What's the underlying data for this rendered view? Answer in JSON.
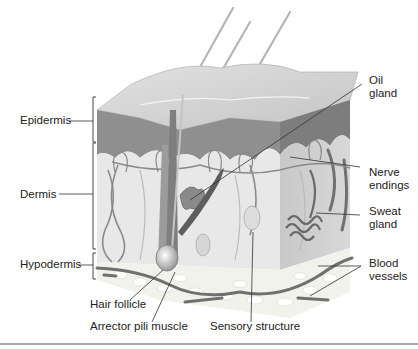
{
  "figure": {
    "truncated_caption_visible": true
  },
  "layers": [
    {
      "id": "epidermis",
      "label": "Epidermis"
    },
    {
      "id": "dermis",
      "label": "Dermis"
    },
    {
      "id": "hypodermis",
      "label": "Hypodermis"
    }
  ],
  "labels": {
    "epidermis": "Epidermis",
    "dermis": "Dermis",
    "hypodermis": "Hypodermis",
    "hair_follicle": "Hair follicle",
    "arrector_pili": "Arrector pili muscle",
    "sensory_structure": "Sensory structure",
    "oil_gland_1": "Oil",
    "oil_gland_2": "gland",
    "nerve_endings_1": "Nerve",
    "nerve_endings_2": "endings",
    "sweat_gland_1": "Sweat",
    "sweat_gland_2": "gland",
    "blood_vessels_1": "Blood",
    "blood_vessels_2": "vessels"
  },
  "colors": {
    "epidermis": "#8f8f8f",
    "epidermis_top": "#d8d8d8",
    "dermis": "#e6e6e6",
    "hypodermis": "#f0f0ea",
    "vessel": "#6e6e6e",
    "nerve": "#b0b0b0",
    "leader": "#333333",
    "rule": "#a8a8a8"
  }
}
